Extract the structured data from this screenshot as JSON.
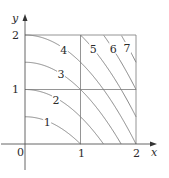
{
  "chart_data": {
    "type": "contour",
    "title": "",
    "function": "f(x, y) = x^2 + 2y",
    "xlabel": "x",
    "ylabel": "y",
    "xlim": [
      0,
      2
    ],
    "ylim": [
      0,
      2
    ],
    "x_ticks": [
      "0",
      "1",
      "2"
    ],
    "y_ticks": [
      "1",
      "2"
    ],
    "grid": {
      "x": [
        1,
        2
      ],
      "y": [
        1,
        2
      ]
    },
    "levels": [
      1,
      2,
      3,
      4,
      5,
      6,
      7
    ],
    "level_labels": [
      {
        "text": "1",
        "x": 0.4,
        "y": 0.4
      },
      {
        "text": "2",
        "x": 0.56,
        "y": 0.81
      },
      {
        "text": "3",
        "x": 0.65,
        "y": 1.28
      },
      {
        "text": "4",
        "x": 0.7,
        "y": 1.72
      },
      {
        "text": "5",
        "x": 1.23,
        "y": 1.75
      },
      {
        "text": "6",
        "x": 1.59,
        "y": 1.75
      },
      {
        "text": "7",
        "x": 1.84,
        "y": 1.76
      }
    ]
  },
  "colors": {
    "curve": "#7a7a7a",
    "axis": "#555555",
    "text": "#2b2b2b"
  }
}
